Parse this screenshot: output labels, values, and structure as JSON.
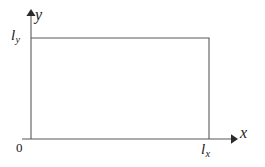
{
  "figure": {
    "type": "geometry-diagram",
    "background_color": "#ffffff",
    "line_color": "#595959",
    "text_color": "#1a1a1a"
  },
  "axes": {
    "x_label": "x",
    "y_label": "y",
    "origin_label": "0",
    "x_axis": {
      "start_px": 22,
      "end_px": 237,
      "y_px": 139,
      "arrow": true
    },
    "y_axis": {
      "start_px": 139,
      "end_px": 10,
      "x_px": 31,
      "arrow": true
    }
  },
  "rectangle": {
    "left_px": 31,
    "right_px": 209,
    "top_px": 38,
    "bottom_px": 139,
    "width_label_base": "l",
    "width_label_sub": "x",
    "height_label_base": "l",
    "height_label_sub": "y",
    "corner_top_left": "(0, l_y)",
    "corner_top_right": "(l_x, l_y)",
    "corner_bottom_right": "(l_x, 0)",
    "corner_bottom_left": "(0, 0)"
  },
  "labels": {
    "ly_base": "l",
    "ly_sub": "y",
    "lx_base": "l",
    "lx_sub": "x"
  }
}
